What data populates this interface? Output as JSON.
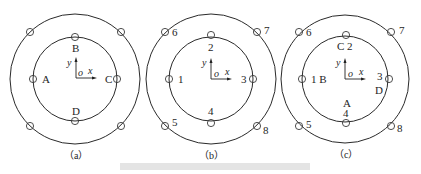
{
  "panels": [
    {
      "id": "a",
      "caption": "（a）",
      "axes": {
        "x": "x",
        "y": "y",
        "origin": "o"
      },
      "inner_points": [
        {
          "pos": "top",
          "label": "B"
        },
        {
          "pos": "left",
          "label": "A"
        },
        {
          "pos": "right",
          "label": "C"
        },
        {
          "pos": "bottom",
          "label": "D"
        }
      ],
      "outer_points": [
        {
          "pos": "top-left",
          "label": ""
        },
        {
          "pos": "top-right",
          "label": ""
        },
        {
          "pos": "bottom-left",
          "label": ""
        },
        {
          "pos": "bottom-right",
          "label": ""
        }
      ]
    },
    {
      "id": "b",
      "caption": "（b）",
      "axes": {
        "x": "x",
        "y": "y",
        "origin": "o"
      },
      "inner_points": [
        {
          "pos": "top",
          "label": "2"
        },
        {
          "pos": "left",
          "label": "1"
        },
        {
          "pos": "right",
          "label": "3"
        },
        {
          "pos": "bottom",
          "label": "4"
        }
      ],
      "outer_points": [
        {
          "pos": "top-left",
          "label": "6"
        },
        {
          "pos": "top-right",
          "label": "7"
        },
        {
          "pos": "bottom-left",
          "label": "5"
        },
        {
          "pos": "bottom-right",
          "label": "8"
        }
      ]
    },
    {
      "id": "c",
      "caption": "（c）",
      "axes": {
        "x": "x",
        "y": "y",
        "origin": "o"
      },
      "inner_points": [
        {
          "pos": "top",
          "label": "C 2"
        },
        {
          "pos": "left",
          "label": "1 B"
        },
        {
          "pos": "right",
          "label": "3"
        },
        {
          "pos": "bottom",
          "label": "4"
        }
      ],
      "extra_labels": [
        {
          "near": "right",
          "label": "D"
        },
        {
          "near": "bottom",
          "label": "A"
        }
      ],
      "outer_points": [
        {
          "pos": "top-left",
          "label": "6"
        },
        {
          "pos": "top-right",
          "label": "7"
        },
        {
          "pos": "bottom-left",
          "label": "5"
        },
        {
          "pos": "bottom-right",
          "label": "8"
        }
      ]
    }
  ]
}
